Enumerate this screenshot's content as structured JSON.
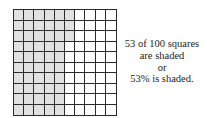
{
  "figure": {
    "grid_rows": 10,
    "grid_cols": 10,
    "total_squares": 100,
    "shaded_squares": 53,
    "shade_order": "column-major, top-to-bottom, left-to-right",
    "shade_color": "#e1e1e1",
    "line_color": "#2a2a2a"
  },
  "caption": {
    "lines": [
      "53 of 100 squares",
      "are shaded",
      "or",
      "53% is shaded."
    ]
  }
}
